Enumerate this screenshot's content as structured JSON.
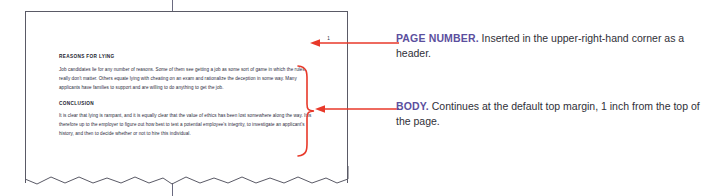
{
  "figure": {
    "colors": {
      "annotation_red": "#e8392a",
      "callout_label_purple": "#5b4f9e",
      "callout_text": "#303038",
      "page_border": "#5a5a66",
      "document_text": "#2c2c3c",
      "page_background": "#ffffff"
    }
  },
  "document": {
    "page_number": "1",
    "sections": [
      {
        "heading": "REASONS FOR LYING",
        "paragraph": "Job candidates lie for any number of reasons. Some of them see getting a job as some sort of game in which the rules really don't matter. Others equate lying with cheating on an exam and rationalize the deception in some way. Many applicants have families to support and are willing to do anything to get the job."
      },
      {
        "heading": "CONCLUSION",
        "paragraph": "It is clear that lying is rampant, and it is equally clear that the value of ethics has been lost somewhere along the way. It is therefore up to the employer to figure out how best to test a potential employee's integrity, to investigate an applicant's history, and then to decide whether or not to hire this individual."
      }
    ]
  },
  "callouts": [
    {
      "label": "PAGE NUMBER.",
      "text": " Inserted in the upper-right-hand corner as a header."
    },
    {
      "label": "BODY.",
      "text": " Continues at the default top margin, 1 inch from the top of the page."
    }
  ]
}
